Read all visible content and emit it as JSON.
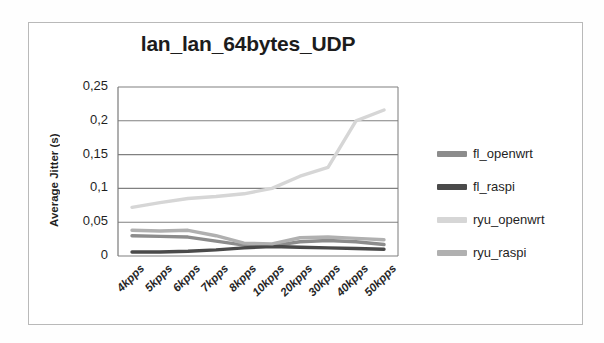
{
  "chart_data": {
    "type": "line",
    "title": "lan_lan_64bytes_UDP",
    "xlabel": "",
    "ylabel": "Average Jitter (s)",
    "categories": [
      "4kpps",
      "5kpps",
      "6kpps",
      "7kpps",
      "8kpps",
      "10kpps",
      "20kpps",
      "30kpps",
      "40kpps",
      "50kpps"
    ],
    "ylim": [
      0,
      0.25
    ],
    "yticks": [
      0,
      0.05,
      0.1,
      0.15,
      0.2,
      0.25
    ],
    "ytick_labels": [
      "0",
      "0,05",
      "0,1",
      "0,15",
      "0,2",
      "0,25"
    ],
    "grid": true,
    "legend_position": "right",
    "series": [
      {
        "name": "fl_openwrt",
        "color": "#8c8c8c",
        "values": [
          0.03,
          0.029,
          0.028,
          0.022,
          0.016,
          0.015,
          0.021,
          0.023,
          0.021,
          0.017
        ]
      },
      {
        "name": "fl_raspi",
        "color": "#4a4a4a",
        "values": [
          0.006,
          0.006,
          0.007,
          0.009,
          0.012,
          0.014,
          0.013,
          0.012,
          0.011,
          0.01
        ]
      },
      {
        "name": "ryu_openwrt",
        "color": "#d6d6d6",
        "values": [
          0.072,
          0.079,
          0.085,
          0.088,
          0.092,
          0.1,
          0.118,
          0.131,
          0.2,
          0.216
        ]
      },
      {
        "name": "ryu_raspi",
        "color": "#b0b0b0",
        "values": [
          0.038,
          0.037,
          0.038,
          0.03,
          0.019,
          0.018,
          0.027,
          0.028,
          0.026,
          0.024
        ]
      }
    ]
  },
  "plot": {
    "area": {
      "left": 118,
      "top": 87,
      "right": 398,
      "bottom": 256
    },
    "grid_color": "#808080",
    "axis_color": "#7a7a7a",
    "background": "#ffffff"
  }
}
